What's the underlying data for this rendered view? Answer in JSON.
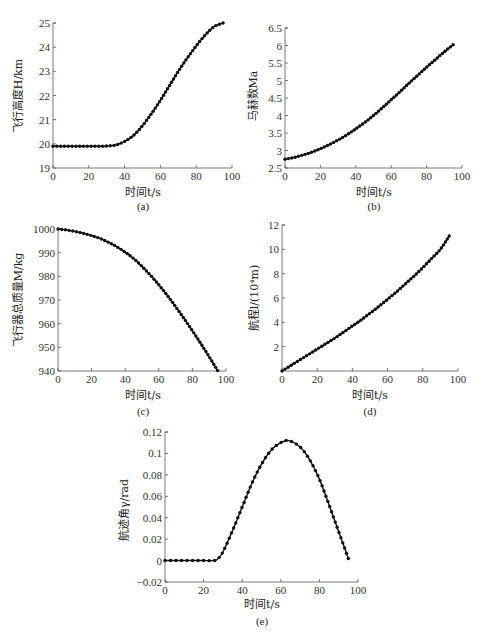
{
  "chart_data": [
    {
      "id": "a",
      "type": "line",
      "caption": "(a)",
      "xlabel": "时间t/s",
      "ylabel": "飞行高度H/km",
      "xlim": [
        0,
        100
      ],
      "ylim": [
        19,
        25
      ],
      "xticks": [
        0,
        20,
        40,
        60,
        80,
        100
      ],
      "yticks": [
        19,
        20,
        21,
        22,
        23,
        24,
        25
      ],
      "grid": false,
      "marker": "dot",
      "x": [
        0,
        5,
        10,
        15,
        20,
        25,
        30,
        35,
        40,
        45,
        50,
        55,
        60,
        65,
        70,
        75,
        80,
        85,
        90,
        95
      ],
      "values": [
        19.9,
        19.9,
        19.9,
        19.9,
        19.9,
        19.9,
        19.91,
        19.95,
        20.1,
        20.35,
        20.75,
        21.25,
        21.8,
        22.4,
        23.0,
        23.55,
        24.05,
        24.5,
        24.85,
        25.0
      ]
    },
    {
      "id": "b",
      "type": "line",
      "caption": "(b)",
      "xlabel": "时间t/s",
      "ylabel": "马赫数Ma",
      "xlim": [
        0,
        100
      ],
      "ylim": [
        2.5,
        6.5
      ],
      "xticks": [
        0,
        20,
        40,
        60,
        80,
        100
      ],
      "yticks": [
        2.5,
        3,
        3.5,
        4,
        4.5,
        5,
        5.5,
        6,
        6.5
      ],
      "grid": false,
      "marker": "dot",
      "x": [
        0,
        5,
        10,
        15,
        20,
        25,
        30,
        35,
        40,
        45,
        50,
        55,
        60,
        65,
        70,
        75,
        80,
        85,
        90,
        95
      ],
      "values": [
        2.75,
        2.8,
        2.87,
        2.95,
        3.05,
        3.17,
        3.3,
        3.45,
        3.62,
        3.8,
        4.0,
        4.22,
        4.45,
        4.68,
        4.92,
        5.15,
        5.38,
        5.6,
        5.82,
        6.02
      ]
    },
    {
      "id": "c",
      "type": "line",
      "caption": "(c)",
      "xlabel": "时间t/s",
      "ylabel": "飞行器总质量M/kg",
      "xlim": [
        0,
        100
      ],
      "ylim": [
        940,
        1000
      ],
      "xticks": [
        0,
        20,
        40,
        60,
        80,
        100
      ],
      "yticks": [
        940,
        950,
        960,
        970,
        980,
        990,
        1000
      ],
      "grid": false,
      "marker": "dot",
      "x": [
        0,
        5,
        10,
        15,
        20,
        25,
        30,
        35,
        40,
        45,
        50,
        55,
        60,
        65,
        70,
        75,
        80,
        85,
        90,
        95
      ],
      "values": [
        1000,
        999.6,
        999.0,
        998.2,
        997.2,
        996.0,
        994.4,
        992.5,
        990.2,
        987.5,
        984.2,
        980.5,
        976.4,
        972.0,
        967.2,
        962.2,
        957.0,
        951.6,
        946.0,
        940.2
      ]
    },
    {
      "id": "d",
      "type": "line",
      "caption": "(d)",
      "xlabel": "时间t/s",
      "ylabel": "航程l/(10⁴m)",
      "xlim": [
        0,
        100
      ],
      "ylim": [
        0,
        12
      ],
      "xticks": [
        0,
        20,
        40,
        60,
        80,
        100
      ],
      "yticks": [
        2,
        4,
        6,
        8,
        10,
        12
      ],
      "grid": false,
      "marker": "dot",
      "x": [
        0,
        5,
        10,
        15,
        20,
        25,
        30,
        35,
        40,
        45,
        50,
        55,
        60,
        65,
        70,
        75,
        80,
        85,
        90,
        95
      ],
      "values": [
        0,
        0.45,
        0.9,
        1.35,
        1.8,
        2.25,
        2.7,
        3.2,
        3.7,
        4.2,
        4.75,
        5.3,
        5.9,
        6.5,
        7.15,
        7.8,
        8.5,
        9.25,
        10.0,
        11.1
      ]
    },
    {
      "id": "e",
      "type": "line",
      "caption": "(e)",
      "xlabel": "时间t/s",
      "ylabel": "航迹角γ/rad",
      "xlim": [
        0,
        100
      ],
      "ylim": [
        -0.02,
        0.12
      ],
      "xticks": [
        0,
        20,
        40,
        60,
        80,
        100
      ],
      "yticks": [
        -0.02,
        0,
        0.02,
        0.04,
        0.06,
        0.08,
        0.1,
        0.12
      ],
      "grid": false,
      "marker": "dot",
      "x": [
        0,
        5,
        10,
        15,
        20,
        25,
        27,
        30,
        35,
        40,
        45,
        50,
        55,
        60,
        64,
        70,
        75,
        80,
        85,
        90,
        95
      ],
      "values": [
        0,
        0,
        0,
        0,
        0,
        0,
        0.001,
        0.008,
        0.028,
        0.05,
        0.072,
        0.09,
        0.103,
        0.11,
        0.112,
        0.106,
        0.094,
        0.076,
        0.052,
        0.027,
        0.002
      ]
    }
  ],
  "labels": {
    "a": {
      "caption": "(a)",
      "xlabel": "时间t/s",
      "ylabel": "飞行高度H/km"
    },
    "b": {
      "caption": "(b)",
      "xlabel": "时间t/s",
      "ylabel": "马赫数Ma"
    },
    "c": {
      "caption": "(c)",
      "xlabel": "时间t/s",
      "ylabel": "飞行器总质量M/kg"
    },
    "d": {
      "caption": "(d)",
      "xlabel": "时间t/s",
      "ylabel": "航程l/(10⁴m)"
    },
    "e": {
      "caption": "(e)",
      "xlabel": "时间t/s",
      "ylabel": "航迹角γ/rad"
    }
  }
}
